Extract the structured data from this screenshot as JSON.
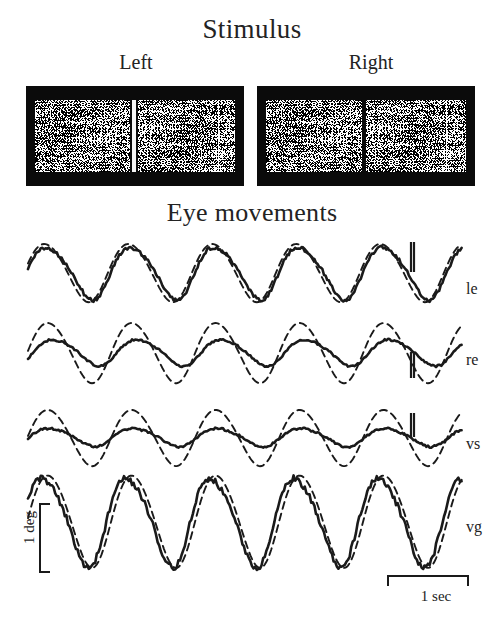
{
  "figure": {
    "stimulus_title": "Stimulus",
    "eye_title": "Eye movements",
    "left_label": "Left",
    "right_label": "Right",
    "ink_color": "#1a1a1a",
    "panel_background": "#0b0b0b"
  },
  "stimulus_panels": [
    {
      "name": "left",
      "label": "Left",
      "divider": "bright-white-bar",
      "divider_color": "#f6f6f6",
      "texture": "random-dot-stereogram"
    },
    {
      "name": "right",
      "label": "Right",
      "divider": "thin-dark-line",
      "divider_color": "#0a0a0a",
      "texture": "random-dot-stereogram"
    }
  ],
  "scale_bars": {
    "vertical_label": "1 deg",
    "horizontal_label": "1 sec"
  },
  "traces": [
    {
      "id": "le",
      "label": "le",
      "name": "left-eye"
    },
    {
      "id": "re",
      "label": "re",
      "name": "right-eye"
    },
    {
      "id": "vs",
      "label": "vs",
      "name": "version"
    },
    {
      "id": "vg",
      "label": "vg",
      "name": "vergence"
    }
  ],
  "chart_data": {
    "type": "line",
    "title": "Eye movements",
    "xlabel": "",
    "ylabel": "",
    "x_scale_bar": "1 sec",
    "y_scale_bar": "1 deg",
    "grid": false,
    "legend": "none",
    "x_range_sec": [
      0,
      5.6
    ],
    "series_styles": {
      "solid": "measured eye movement",
      "dashed": "stimulus / reference waveform"
    },
    "panels": [
      {
        "id": "le",
        "label": "le",
        "baseline_y": 272,
        "cycles": 5,
        "period_px": 84,
        "solid": {
          "style": "solid",
          "amplitude_px": 26,
          "phase_deg": 0,
          "artifact": {
            "type": "blink-spike",
            "x_px": 411,
            "direction": "up",
            "height_px": 30
          }
        },
        "dashed": {
          "style": "dashed",
          "amplitude_px": 29,
          "phase_deg": 14
        }
      },
      {
        "id": "re",
        "label": "re",
        "baseline_y": 352,
        "cycles": 5,
        "period_px": 84,
        "solid": {
          "style": "solid",
          "amplitude_px": 13,
          "phase_deg": -28,
          "artifact": {
            "type": "blink-spike",
            "x_px": 411,
            "direction": "down",
            "height_px": 26
          }
        },
        "dashed": {
          "style": "dashed",
          "amplitude_px": 30,
          "phase_deg": 0
        }
      },
      {
        "id": "vs",
        "label": "vs",
        "baseline_y": 437,
        "cycles": 5,
        "period_px": 84,
        "solid": {
          "style": "solid",
          "amplitude_px": 9,
          "phase_deg": -10,
          "artifact": {
            "type": "blink-spike",
            "x_px": 411,
            "direction": "up",
            "height_px": 24
          }
        },
        "dashed": {
          "style": "dashed",
          "amplitude_px": 28,
          "phase_deg": 0
        }
      },
      {
        "id": "vg",
        "label": "vg",
        "baseline_y": 520,
        "cycles": 5,
        "period_px": 84,
        "solid": {
          "style": "solid",
          "amplitude_px": 44,
          "phase_deg": 18
        },
        "dashed": {
          "style": "dashed",
          "amplitude_px": 46,
          "phase_deg": 0
        }
      }
    ]
  }
}
